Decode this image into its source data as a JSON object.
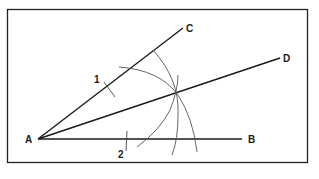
{
  "figure": {
    "points": {
      "A": {
        "label": "A",
        "x": 38,
        "y": 139
      },
      "B": {
        "label": "B",
        "x": 242,
        "y": 139
      },
      "C": {
        "label": "C",
        "x": 183,
        "y": 28
      },
      "D": {
        "label": "D",
        "x": 280,
        "y": 58
      }
    },
    "arc_marks": [
      {
        "label": "1"
      },
      {
        "label": "2"
      }
    ],
    "colors": {
      "line": "#1a1a1a",
      "arc": "#555555",
      "frame": "#222222",
      "background": "#ffffff"
    }
  }
}
